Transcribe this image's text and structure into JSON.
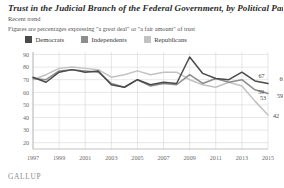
{
  "header": {
    "title": "Trust in the Judicial Branch of the Federal Government, by Political Party",
    "subhead": "Recent trend",
    "note": "Figures are percentages expressing \"a great deal\" or \"a fair amount\" of trust"
  },
  "brand": "GALLUP",
  "colors": {
    "democrats": "#4a4a4a",
    "independents": "#8d8d8d",
    "republicans": "#c2c2c2",
    "grid": "#cfcfcf",
    "axis": "#9a9a9a",
    "text": "#555555"
  },
  "chart_data": {
    "type": "line",
    "title": "Trust in the Judicial Branch of the Federal Government, by Political Party",
    "subtitle": "Recent trend",
    "annotation": "Figures are percentages expressing \"a great deal\" or \"a fair amount\" of trust",
    "xlabel": "",
    "ylabel": "",
    "ylim": [
      15,
      92
    ],
    "yticks": [
      90,
      80,
      70,
      60,
      50,
      40,
      30,
      20
    ],
    "x": [
      1997,
      1998,
      1999,
      2000,
      2001,
      2002,
      2003,
      2004,
      2005,
      2006,
      2007,
      2008,
      2009,
      2010,
      2011,
      2012,
      2013,
      2014,
      2015
    ],
    "xticks": [
      1997,
      1999,
      2001,
      2003,
      2005,
      2007,
      2009,
      2011,
      2013,
      2015
    ],
    "grid": true,
    "legend_position": "top-left",
    "series": [
      {
        "name": "Democrats",
        "color": "#4a4a4a",
        "values": [
          72,
          68,
          76,
          78,
          76,
          77,
          66,
          64,
          70,
          66,
          68,
          67,
          88,
          75,
          71,
          70,
          76,
          69,
          67
        ],
        "end_labels": [
          {
            "year": 2014,
            "value": 67
          },
          {
            "year": 2015,
            "value": 66
          }
        ]
      },
      {
        "name": "Independents",
        "color": "#8d8d8d",
        "values": [
          71,
          70,
          77,
          78,
          77,
          76,
          67,
          64,
          70,
          65,
          67,
          66,
          74,
          67,
          71,
          68,
          70,
          62,
          59
        ],
        "end_labels": [
          {
            "year": 2014,
            "value": 59
          },
          {
            "year": 2015,
            "value": 59
          }
        ]
      },
      {
        "name": "Republicans",
        "color": "#c2c2c2",
        "values": [
          70,
          74,
          79,
          80,
          79,
          78,
          72,
          74,
          77,
          74,
          76,
          76,
          70,
          66,
          64,
          68,
          65,
          53,
          42
        ],
        "end_labels": [
          {
            "year": 2014,
            "value": 53
          },
          {
            "year": 2015,
            "value": 42
          }
        ]
      }
    ],
    "legend": [
      "Democrats",
      "Independents",
      "Republicans"
    ]
  }
}
